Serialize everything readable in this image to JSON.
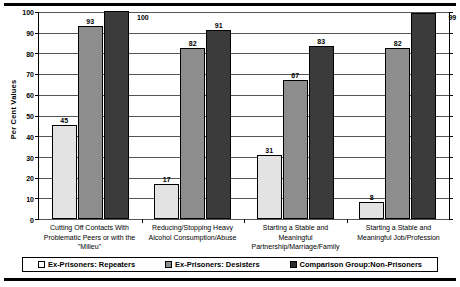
{
  "chart_data": {
    "type": "bar",
    "title": "",
    "xlabel": "",
    "ylabel": "Per Cent Values",
    "ylim": [
      0,
      100
    ],
    "yticks": [
      0,
      10,
      20,
      30,
      40,
      50,
      60,
      70,
      80,
      90,
      100
    ],
    "grid": true,
    "legend_position": "bottom",
    "categories": [
      "Cutting Off Contacts With Problematic Peers or with the \"Milieu\"",
      "Reducing/Stopping Heavy Alcohol Consumption/Abuse",
      "Starting a Stable and Meaningful Partnership/Marriage/Family",
      "Starting a Stable and Meaningful Job/Profession"
    ],
    "category_lines": [
      [
        "Cutting Off Contacts With",
        "Problematic Peers or with the",
        "\"Milieu\""
      ],
      [
        "Reducing/Stopping Heavy",
        "Alcohol Consumption/Abuse"
      ],
      [
        "Starting a Stable and",
        "Meaningful",
        "Partnership/Marriage/Family"
      ],
      [
        "Starting a Stable and",
        "Meaningful Job/Profession"
      ]
    ],
    "series": [
      {
        "name": "Ex-Prisoners: Repeaters",
        "color": "#e3e3e3",
        "values": [
          45,
          17,
          31,
          8
        ]
      },
      {
        "name": "Ex-Prisoners: Desisters",
        "color": "#8d8d8d",
        "values": [
          93,
          82,
          67,
          82
        ]
      },
      {
        "name": "Comparison Group:Non-Prisoners",
        "color": "#3b3b3b",
        "values": [
          100,
          91,
          83,
          99
        ]
      }
    ]
  },
  "legend": {
    "items": [
      {
        "label": "Ex-Prisoners: Repeaters"
      },
      {
        "label": "Ex-Prisoners: Desisters"
      },
      {
        "label": "Comparison Group:Non-Prisoners"
      }
    ]
  }
}
